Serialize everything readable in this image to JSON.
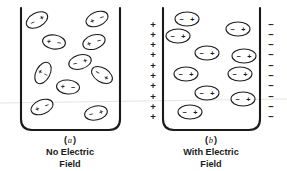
{
  "figure": {
    "background_color": "#ffffff",
    "ink_color": "#1a1a1a",
    "width": 287,
    "height": 171,
    "panels": [
      {
        "id": "a",
        "label": "(a)",
        "label_letter": "a",
        "caption_line1": "No Electric",
        "caption_line2": "Field",
        "container": {
          "x": 21,
          "y": 8,
          "width": 99,
          "height": 122,
          "corner_radius": 11
        },
        "has_plates": false,
        "dipole_orientation": "random",
        "dipoles": [
          {
            "cx": 37,
            "cy": 20,
            "rx": 11.5,
            "ry": 7.0,
            "rot": -28,
            "left_sign": "−",
            "right_sign": "+"
          },
          {
            "cx": 97,
            "cy": 19,
            "rx": 11.5,
            "ry": 7.0,
            "rot": -22,
            "left_sign": "+",
            "right_sign": "−"
          },
          {
            "cx": 54,
            "cy": 42,
            "rx": 11.5,
            "ry": 7.0,
            "rot": 8,
            "left_sign": "+",
            "right_sign": "−"
          },
          {
            "cx": 94,
            "cy": 42,
            "rx": 11.5,
            "ry": 7.0,
            "rot": -18,
            "left_sign": "+",
            "right_sign": "−"
          },
          {
            "cx": 80,
            "cy": 62,
            "rx": 11.5,
            "ry": 7.0,
            "rot": -16,
            "left_sign": "−",
            "right_sign": "+"
          },
          {
            "cx": 43,
            "cy": 73,
            "rx": 7.0,
            "ry": 11.5,
            "rot": 28,
            "left_sign": "+",
            "right_sign": "−"
          },
          {
            "cx": 102,
            "cy": 75,
            "rx": 11.5,
            "ry": 7.0,
            "rot": 32,
            "left_sign": "−",
            "right_sign": "+"
          },
          {
            "cx": 68,
            "cy": 87,
            "rx": 11.5,
            "ry": 7.0,
            "rot": 5,
            "left_sign": "+",
            "right_sign": "−"
          },
          {
            "cx": 42,
            "cy": 107,
            "rx": 11.5,
            "ry": 7.0,
            "rot": -22,
            "left_sign": "+",
            "right_sign": "−"
          },
          {
            "cx": 96,
            "cy": 113,
            "rx": 11.5,
            "ry": 7.0,
            "rot": -12,
            "left_sign": "−",
            "right_sign": "+"
          }
        ]
      },
      {
        "id": "b",
        "label": "(b)",
        "label_letter": "b",
        "caption_line1": "With Electric",
        "caption_line2": "Field",
        "container": {
          "x": 163,
          "y": 8,
          "width": 97,
          "height": 122,
          "corner_radius": 11
        },
        "has_plates": true,
        "dipole_orientation": "aligned-horizontal",
        "left_plate": {
          "sign": "+",
          "count": 10,
          "x": 153,
          "y_start": 24,
          "y_step": 10.3
        },
        "right_plate": {
          "sign": "−",
          "count": 10,
          "x": 271,
          "y_start": 24,
          "y_step": 10.3
        },
        "dipoles": [
          {
            "cx": 187,
            "cy": 19,
            "rx": 12.0,
            "ry": 7.0,
            "rot": 0,
            "left_sign": "−",
            "right_sign": "+"
          },
          {
            "cx": 238,
            "cy": 29,
            "rx": 12.0,
            "ry": 7.0,
            "rot": 0,
            "left_sign": "−",
            "right_sign": "+"
          },
          {
            "cx": 178,
            "cy": 36,
            "rx": 12.0,
            "ry": 7.0,
            "rot": 0,
            "left_sign": "−",
            "right_sign": "+"
          },
          {
            "cx": 207,
            "cy": 53,
            "rx": 12.0,
            "ry": 7.0,
            "rot": 0,
            "left_sign": "−",
            "right_sign": "+"
          },
          {
            "cx": 244,
            "cy": 56,
            "rx": 12.0,
            "ry": 7.0,
            "rot": 0,
            "left_sign": "−",
            "right_sign": "+"
          },
          {
            "cx": 186,
            "cy": 74,
            "rx": 12.0,
            "ry": 7.0,
            "rot": 0,
            "left_sign": "−",
            "right_sign": "+"
          },
          {
            "cx": 240,
            "cy": 74,
            "rx": 12.0,
            "ry": 7.0,
            "rot": 0,
            "left_sign": "−",
            "right_sign": "+"
          },
          {
            "cx": 207,
            "cy": 93,
            "rx": 12.0,
            "ry": 7.0,
            "rot": 0,
            "left_sign": "−",
            "right_sign": "+"
          },
          {
            "cx": 243,
            "cy": 99,
            "rx": 12.0,
            "ry": 7.0,
            "rot": 0,
            "left_sign": "−",
            "right_sign": "+"
          },
          {
            "cx": 190,
            "cy": 112,
            "rx": 12.0,
            "ry": 7.0,
            "rot": 0,
            "left_sign": "−",
            "right_sign": "+"
          }
        ]
      }
    ],
    "captions": [
      {
        "label_x": 70,
        "label_y": 140,
        "line1_x": 70,
        "line1_y": 152,
        "line2_x": 70,
        "line2_y": 164
      },
      {
        "label_x": 211,
        "label_y": 140,
        "line1_x": 211,
        "line1_y": 152,
        "line2_x": 211,
        "line2_y": 164
      }
    ],
    "scan_artifact": {
      "y_left": 103,
      "y_right": 99
    }
  }
}
